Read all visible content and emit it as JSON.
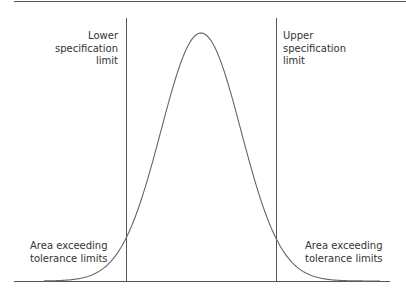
{
  "chart_data": {
    "type": "line",
    "title": "",
    "distribution": {
      "kind": "normal",
      "mean_px": 201,
      "sigma_px": 40,
      "peak_y_px": 33,
      "baseline_y_px": 281
    },
    "x_range_px": [
      14,
      390
    ],
    "spec_limits": {
      "lower": {
        "x_px": 126,
        "label": [
          "Lower",
          "specification",
          "limit"
        ]
      },
      "upper": {
        "x_px": 276,
        "label": [
          "Upper",
          "specification",
          "limit"
        ]
      }
    },
    "annotations": [
      {
        "side": "left",
        "lines": [
          "Area exceeding",
          "tolerance limits"
        ]
      },
      {
        "side": "right",
        "lines": [
          "Area exceeding",
          "tolerance limits"
        ]
      }
    ],
    "grid": false,
    "xlabel": "",
    "ylabel": ""
  },
  "colors": {
    "line": "#555555",
    "curve": "#666666",
    "text": "#333333",
    "background": "#ffffff"
  },
  "labels": {
    "lower_spec": [
      "Lower",
      "specification",
      "limit"
    ],
    "upper_spec": [
      "Upper",
      "specification",
      "limit"
    ],
    "left_area": [
      "Area exceeding",
      "tolerance limits"
    ],
    "right_area": [
      "Area exceeding",
      "tolerance limits"
    ]
  }
}
